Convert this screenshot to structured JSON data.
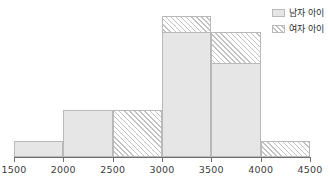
{
  "chart_data": {
    "type": "bar",
    "title": "",
    "xlabel": "",
    "ylabel": "",
    "grid": false,
    "legend_position": "top-right",
    "xlim": [
      1500,
      4500
    ],
    "ylim": [
      0,
      9.5
    ],
    "bin_width": 500,
    "bin_edges": [
      1500,
      2000,
      2500,
      3000,
      3500,
      4000,
      4500
    ],
    "categories": [
      "1500-2000",
      "2000-2500",
      "2500-3000",
      "3000-3500",
      "3500-4000",
      "4000-4500"
    ],
    "xticks": [
      "1500",
      "2000",
      "2500",
      "3000",
      "3500",
      "4000",
      "4500"
    ],
    "series": [
      {
        "name": "남자 아이",
        "style": "solid-gray",
        "values": [
          1,
          3,
          0,
          8,
          6,
          0
        ]
      },
      {
        "name": "여자 아이",
        "style": "hatched",
        "values": [
          1,
          1,
          3,
          9,
          8,
          1
        ]
      }
    ]
  },
  "legend": {
    "items": [
      {
        "label": "남자 아이",
        "swatch": "solid-gray-swatch"
      },
      {
        "label": "여자 아이",
        "swatch": "hatched-swatch"
      }
    ]
  },
  "colors": {
    "bar_fill": "#e6e6e6",
    "bar_edge": "#b9b9b9",
    "hatch": "#c2c2c2",
    "axis": "#6e6e6e",
    "text": "#2e2e2e"
  }
}
